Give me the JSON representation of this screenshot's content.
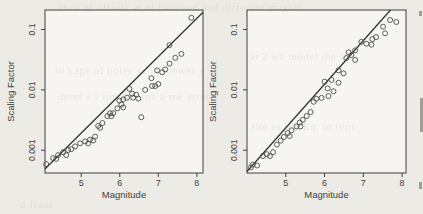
{
  "colors": {
    "paper": "#edebe6",
    "panel_bg": "#f6f5f1",
    "ink": "#3f3f3f",
    "point_stroke": "#4d4d4d",
    "line_color": "#2f2f2f"
  },
  "bleedthrough_fragments": [
    {
      "text": "ance of offsets at of between and different magnit"
    },
    {
      "text": "at 2 we model the int"
    },
    {
      "text": "to kape of poles as int power s"
    },
    {
      "text": "deret a s tim cartson a me arture"
    },
    {
      "text": "alle es tha Eq. to repl"
    },
    {
      "text": "d fsaul"
    }
  ],
  "chart_data": [
    {
      "type": "scatter",
      "panel": "left",
      "xlabel": "Magnitude",
      "ylabel": "Scaling Factor",
      "x_scale": "linear",
      "y_scale": "log",
      "xlim": [
        4.06,
        8.16
      ],
      "ylim": [
        0.00042,
        0.21
      ],
      "xticks": [
        5,
        6,
        7,
        8
      ],
      "xtick_labels": [
        "5",
        "6",
        "7",
        "8"
      ],
      "yticks": [
        0.001,
        0.01,
        0.1
      ],
      "ytick_labels": [
        "0.001",
        "0.01",
        "0.1"
      ],
      "grid": false,
      "legend": null,
      "fit_line": {
        "x": [
          4.06,
          8.16
        ],
        "y": [
          0.00049,
          0.193
        ]
      },
      "points": [
        [
          4.09,
          0.00059
        ],
        [
          4.27,
          0.00074
        ],
        [
          4.35,
          0.00072
        ],
        [
          4.4,
          0.00083
        ],
        [
          4.53,
          0.00093
        ],
        [
          4.61,
          0.00083
        ],
        [
          4.66,
          0.00101
        ],
        [
          4.74,
          0.00104
        ],
        [
          4.84,
          0.00116
        ],
        [
          4.97,
          0.0013
        ],
        [
          5.1,
          0.0014
        ],
        [
          5.18,
          0.0013
        ],
        [
          5.23,
          0.0015
        ],
        [
          5.31,
          0.00145
        ],
        [
          5.36,
          0.00168
        ],
        [
          5.44,
          0.00253
        ],
        [
          5.49,
          0.00235
        ],
        [
          5.55,
          0.00283
        ],
        [
          5.68,
          0.00367
        ],
        [
          5.75,
          0.00411
        ],
        [
          5.78,
          0.00367
        ],
        [
          5.83,
          0.00411
        ],
        [
          5.94,
          0.00494
        ],
        [
          5.99,
          0.00665
        ],
        [
          6.04,
          0.00572
        ],
        [
          6.09,
          0.00512
        ],
        [
          6.09,
          0.00691
        ],
        [
          6.19,
          0.00742
        ],
        [
          6.25,
          0.0104
        ],
        [
          6.32,
          0.00863
        ],
        [
          6.35,
          0.00742
        ],
        [
          6.43,
          0.0083
        ],
        [
          6.48,
          0.00716
        ],
        [
          6.56,
          0.00353
        ],
        [
          6.66,
          0.01
        ],
        [
          6.82,
          0.0156
        ],
        [
          6.84,
          0.0116
        ],
        [
          6.92,
          0.0116
        ],
        [
          6.97,
          0.021
        ],
        [
          7.0,
          0.0125
        ],
        [
          7.1,
          0.0195
        ],
        [
          7.18,
          0.0218
        ],
        [
          7.29,
          0.055
        ],
        [
          7.29,
          0.0272
        ],
        [
          7.44,
          0.034
        ],
        [
          7.6,
          0.0394
        ],
        [
          7.86,
          0.156
        ]
      ]
    },
    {
      "type": "scatter",
      "panel": "right",
      "xlabel": "Magnitude",
      "ylabel": "Scaling Factor",
      "x_scale": "linear",
      "y_scale": "log",
      "xlim": [
        4.0,
        8.1
      ],
      "ylim": [
        0.00042,
        0.21
      ],
      "xticks": [
        5,
        6,
        7,
        8
      ],
      "xtick_labels": [
        "5",
        "6",
        "7",
        "8"
      ],
      "yticks": [
        0.001,
        0.01,
        0.1
      ],
      "ytick_labels": [
        "0.001",
        "0.01",
        "0.1"
      ],
      "grid": false,
      "legend": null,
      "fit_line": {
        "x": [
          4.0,
          7.7
        ],
        "y": [
          0.000445,
          0.21
        ]
      },
      "points": [
        [
          4.1,
          0.00052
        ],
        [
          4.15,
          0.00058
        ],
        [
          4.26,
          0.00056
        ],
        [
          4.41,
          0.0008
        ],
        [
          4.51,
          0.00086
        ],
        [
          4.59,
          0.0008
        ],
        [
          4.67,
          0.00093
        ],
        [
          4.77,
          0.00124
        ],
        [
          4.87,
          0.00144
        ],
        [
          4.95,
          0.00166
        ],
        [
          5.05,
          0.00192
        ],
        [
          5.1,
          0.00172
        ],
        [
          5.15,
          0.00214
        ],
        [
          5.28,
          0.00248
        ],
        [
          5.36,
          0.00287
        ],
        [
          5.38,
          0.00248
        ],
        [
          5.44,
          0.00319
        ],
        [
          5.54,
          0.00369
        ],
        [
          5.64,
          0.00428
        ],
        [
          5.72,
          0.00635
        ],
        [
          5.79,
          0.0071
        ],
        [
          5.92,
          0.00736
        ],
        [
          6.0,
          0.01365
        ],
        [
          6.08,
          0.01055
        ],
        [
          6.1,
          0.00789
        ],
        [
          6.18,
          0.01464
        ],
        [
          6.23,
          0.00947
        ],
        [
          6.36,
          0.021
        ],
        [
          6.36,
          0.0131
        ],
        [
          6.49,
          0.0188
        ],
        [
          6.56,
          0.0336
        ],
        [
          6.62,
          0.0418
        ],
        [
          6.69,
          0.0376
        ],
        [
          6.79,
          0.045
        ],
        [
          6.79,
          0.0313
        ],
        [
          6.95,
          0.0624
        ],
        [
          7.08,
          0.058
        ],
        [
          7.21,
          0.0559
        ],
        [
          7.23,
          0.0693
        ],
        [
          7.33,
          0.0746
        ],
        [
          7.51,
          0.111
        ],
        [
          7.56,
          0.0865
        ],
        [
          7.69,
          0.1435
        ],
        [
          7.85,
          0.133
        ]
      ]
    }
  ]
}
